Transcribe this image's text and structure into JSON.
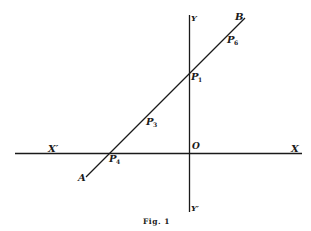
{
  "figure": {
    "caption": "Fig. 1",
    "colors": {
      "ink": "#1a1a1a",
      "background": "#ffffff"
    },
    "axes": {
      "x_positive_label": "X",
      "x_negative_label": "X′",
      "y_positive_label": "Y",
      "y_negative_label": "Y′",
      "origin_label": "O"
    },
    "line": {
      "start_label": "A",
      "end_label": "B"
    },
    "points": [
      {
        "name": "P",
        "subscript": "1",
        "description": "intersection of line AB with Y axis"
      },
      {
        "name": "P",
        "subscript": "3",
        "description": "point on AB between X axis and Y axis"
      },
      {
        "name": "P",
        "subscript": "4",
        "description": "intersection of line AB with X axis"
      },
      {
        "name": "P",
        "subscript": "6",
        "description": "point on AB near B"
      }
    ]
  }
}
